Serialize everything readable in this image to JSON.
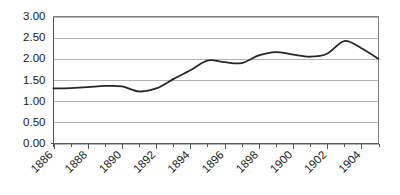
{
  "chart_data": {
    "type": "line",
    "title": "",
    "subtitle": "",
    "xlabel": "",
    "ylabel": "",
    "ylim": [
      0.0,
      3.0
    ],
    "xlim": [
      1886,
      1905
    ],
    "grid": true,
    "legend": false,
    "legend_position": "none",
    "line_color": "#262626",
    "gridline_color": "#b3b3b3",
    "border_color": "#808080",
    "background_color": "#ffffff",
    "ytick_labels": [
      "0.00",
      "0.50",
      "1.00",
      "1.50",
      "2.00",
      "2.50",
      "3.00"
    ],
    "ytick_values": [
      0.0,
      0.5,
      1.0,
      1.5,
      2.0,
      2.5,
      3.0
    ],
    "xtick_labels": [
      "1886",
      "1888",
      "1890",
      "1892",
      "1894",
      "1896",
      "1898",
      "1900",
      "1902",
      "1904"
    ],
    "xtick_values": [
      1886,
      1888,
      1890,
      1892,
      1894,
      1896,
      1898,
      1900,
      1902,
      1904
    ],
    "x": [
      1886,
      1887,
      1888,
      1889,
      1890,
      1891,
      1892,
      1893,
      1894,
      1895,
      1896,
      1897,
      1898,
      1899,
      1900,
      1901,
      1902,
      1903,
      1904,
      1905
    ],
    "values": [
      1.3,
      1.31,
      1.33,
      1.36,
      1.35,
      1.23,
      1.3,
      1.52,
      1.73,
      1.96,
      1.92,
      1.9,
      2.08,
      2.16,
      2.1,
      2.05,
      2.12,
      2.42,
      2.25,
      2.0
    ],
    "series": [
      {
        "name": "series-1",
        "values": [
          1.3,
          1.31,
          1.33,
          1.36,
          1.35,
          1.23,
          1.3,
          1.52,
          1.73,
          1.96,
          1.92,
          1.9,
          2.08,
          2.16,
          2.1,
          2.05,
          2.12,
          2.42,
          2.25,
          2.0
        ]
      }
    ]
  }
}
